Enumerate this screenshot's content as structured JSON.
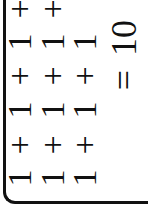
{
  "expression": {
    "lines": [
      {
        "tokens": [
          "1",
          "+",
          "1",
          "+",
          "1",
          "+"
        ]
      },
      {
        "tokens": [
          "1",
          "+",
          "1",
          "+",
          "1",
          "+"
        ]
      },
      {
        "tokens": [
          "1",
          "+",
          "1",
          "+",
          "1"
        ]
      }
    ],
    "equals": "=",
    "result": "10"
  },
  "colors": {
    "ink": "#111111",
    "background": "#ffffff"
  }
}
